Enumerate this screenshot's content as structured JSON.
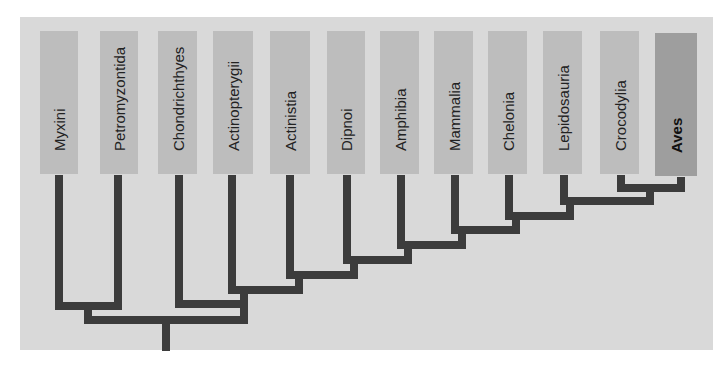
{
  "diagram": {
    "type": "cladogram",
    "colors": {
      "panel_background": "#d9d9d9",
      "taxon_box": "#bdbdbd",
      "taxon_box_highlight": "#9e9e9e",
      "branch": "#3c3c3c"
    },
    "taxa": [
      {
        "label": "Myxini",
        "highlight": false
      },
      {
        "label": "Petromyzontida",
        "highlight": false
      },
      {
        "label": "Chondrichthyes",
        "highlight": false
      },
      {
        "label": "Actinopterygii",
        "highlight": false
      },
      {
        "label": "Actinistia",
        "highlight": false
      },
      {
        "label": "Dipnoi",
        "highlight": false
      },
      {
        "label": "Amphibia",
        "highlight": false
      },
      {
        "label": "Mammalia",
        "highlight": false
      },
      {
        "label": "Chelonia",
        "highlight": false
      },
      {
        "label": "Lepidosauria",
        "highlight": false
      },
      {
        "label": "Crocodylia",
        "highlight": false
      },
      {
        "label": "Aves",
        "highlight": true
      }
    ],
    "topology": "((Myxini,Petromyzontida),(Chondrichthyes,(Actinopterygii,(Actinistia,(Dipnoi,(Amphibia,(Mammalia,(Chelonia,(Lepidosauria,(Crocodylia,Aves))))))))))"
  }
}
